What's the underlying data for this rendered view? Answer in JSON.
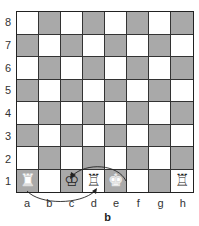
{
  "diagram": {
    "caption": "b",
    "ranks": [
      "8",
      "7",
      "6",
      "5",
      "4",
      "3",
      "2",
      "1"
    ],
    "files": [
      "a",
      "b",
      "c",
      "d",
      "e",
      "f",
      "g",
      "h"
    ],
    "colors": {
      "light": "#ffffff",
      "dark": "#a9a9a9",
      "grid": "#333333"
    },
    "pieces": {
      "a1": {
        "glyph": "♜",
        "type": "rook",
        "style": "solid"
      },
      "c1": {
        "glyph": "♔",
        "type": "king",
        "style": "outline"
      },
      "d1": {
        "glyph": "♖",
        "type": "rook",
        "style": "outline"
      },
      "e1": {
        "glyph": "♚",
        "type": "king",
        "style": "solid"
      },
      "h1": {
        "glyph": "♖",
        "type": "rook",
        "style": "outline"
      }
    },
    "moves": [
      {
        "piece": "king",
        "from": "e1",
        "to": "c1",
        "arc": "above"
      },
      {
        "piece": "rook",
        "from": "a1",
        "to": "d1",
        "arc": "below"
      }
    ]
  }
}
